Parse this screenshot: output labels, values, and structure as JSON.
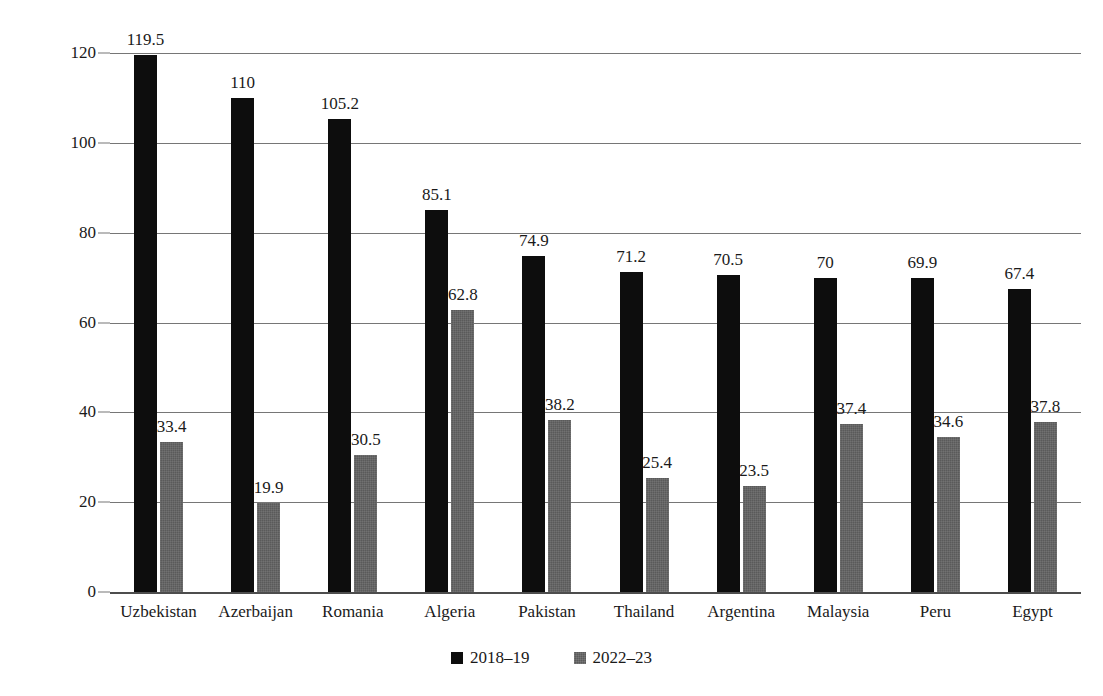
{
  "chart_data": {
    "type": "bar",
    "title": "",
    "subtitle": "",
    "xlabel": "",
    "ylabel": "Year-over-year Growth Rate (%)",
    "ylim": [
      0,
      120
    ],
    "ytick_labels": [
      "0",
      "20",
      "40",
      "60",
      "80",
      "100",
      "120"
    ],
    "yticks": [
      0,
      20,
      40,
      60,
      80,
      100,
      120
    ],
    "grid": true,
    "legend_position": "bottom",
    "categories": [
      "Uzbekistan",
      "Azerbaijan",
      "Romania",
      "Algeria",
      "Pakistan",
      "Thailand",
      "Argentina",
      "Malaysia",
      "Peru",
      "Egypt"
    ],
    "series": [
      {
        "name": "2018–19",
        "color": "#0d0d0d",
        "values": [
          119.5,
          110,
          105.2,
          85.1,
          74.9,
          71.2,
          70.5,
          70,
          69.9,
          67.4
        ],
        "labels": [
          "119.5",
          "110",
          "105.2",
          "85.1",
          "74.9",
          "71.2",
          "70.5",
          "70",
          "69.9",
          "67.4"
        ]
      },
      {
        "name": "2022–23",
        "color": "#5a5a5a",
        "values": [
          33.4,
          19.9,
          30.5,
          62.8,
          38.2,
          25.4,
          23.5,
          37.4,
          34.6,
          37.8
        ],
        "labels": [
          "33.4",
          "19.9",
          "30.5",
          "62.8",
          "38.2",
          "25.4",
          "23.5",
          "37.4",
          "34.6",
          "37.8"
        ]
      }
    ]
  },
  "legend": {
    "items": [
      {
        "label": "2018–19",
        "swatch": "black-square-icon"
      },
      {
        "label": "2022–23",
        "swatch": "gray-square-icon"
      }
    ]
  },
  "axis": {
    "y_title": "Year-over-year Growth Rate (%)"
  }
}
